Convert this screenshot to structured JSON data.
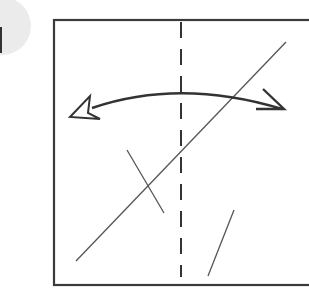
{
  "diagram": {
    "type": "origami-fold-step",
    "step_badge": {
      "label": "1",
      "fill": "#ebebeb",
      "text_color": "#333333"
    },
    "paper": {
      "stroke": "#3a3a3a",
      "fill": "#ffffff"
    },
    "fold_line": {
      "style": "dashed",
      "kind": "valley-fold",
      "stroke": "#333333"
    },
    "crease_lines": {
      "stroke": "#555555",
      "count": 3
    },
    "action_arrow": {
      "kind": "fold-and-unfold",
      "direction": "bidirectional",
      "stroke": "#333333"
    }
  }
}
